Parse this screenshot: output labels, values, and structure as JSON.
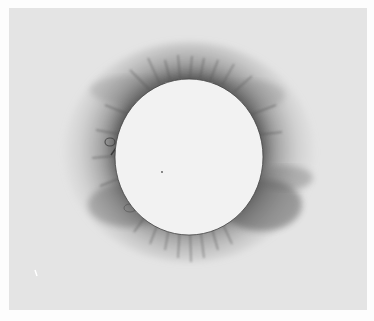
{
  "image": {
    "subject": "total solar eclipse corona drawing",
    "style": "grayscale illustration",
    "background_color": "#e4e4e4",
    "border_color": "#fdfdfd",
    "disk_color": "#f2f2f2",
    "corona_color": "#4a4a4a",
    "disk": {
      "cx": 189,
      "cy": 148,
      "rx": 74,
      "ry": 78
    }
  }
}
